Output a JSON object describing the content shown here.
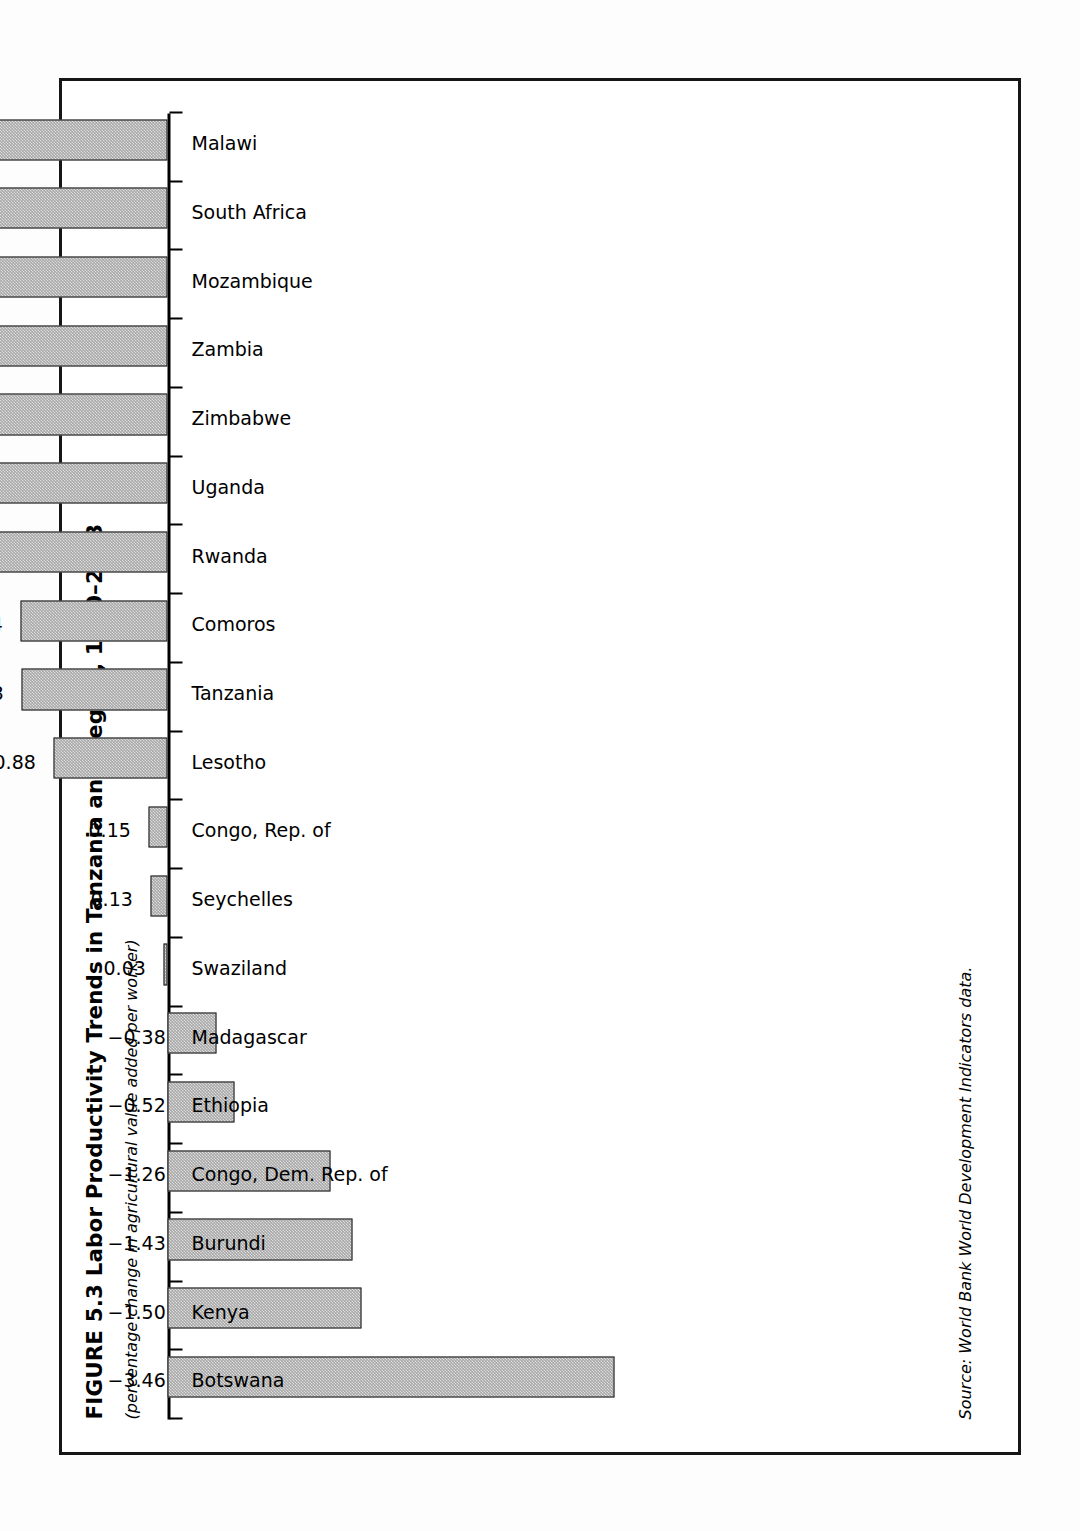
{
  "figure": {
    "title": "FIGURE 5.3  Labor Productivity Trends in Tanzania and Region, 1990–2003",
    "subtitle": "(percentage change in agricultural value added per worker)",
    "source": "Source: World Bank World Development Indicators data."
  },
  "chart_data": {
    "type": "bar",
    "title": "FIGURE 5.3  Labor Productivity Trends in Tanzania and Region, 1990–2003",
    "subtitle": "(percentage change in agricultural value added per worker)",
    "xlabel": "",
    "ylabel": "percentage change in agricultural value added per worker",
    "ylim": [
      -3.6,
      5.7
    ],
    "grid": false,
    "legend": "none",
    "orientation": "vertical",
    "bar_color": "#a8a8a8",
    "bar_edge_color": "#1a1a1a",
    "categories": [
      "Botswana",
      "Kenya",
      "Burundi",
      "Congo, Dem. Rep. of",
      "Ethiopia",
      "Madagascar",
      "Swaziland",
      "Seychelles",
      "Congo, Rep. of",
      "Lesotho",
      "Tanzania",
      "Comoros",
      "Rwanda",
      "Uganda",
      "Zimbabwe",
      "Zambia",
      "Mozambique",
      "South Africa",
      "Malawi"
    ],
    "values": [
      -3.46,
      -1.5,
      -1.43,
      -1.26,
      -0.52,
      -0.38,
      0.03,
      0.13,
      0.15,
      0.88,
      1.13,
      1.14,
      1.78,
      1.82,
      1.92,
      2.15,
      2.3,
      2.45,
      5.46
    ],
    "value_labels": [
      "−3.46",
      "−1.50",
      "−1.43",
      "−1.26",
      "−0.52",
      "−0.38",
      "0.03",
      "0.13",
      "0.15",
      "0.88",
      "1.13",
      "1.14",
      "1.78",
      "1.82",
      "1.92",
      "2.15",
      "2.30",
      "2.45",
      "5.46"
    ]
  }
}
